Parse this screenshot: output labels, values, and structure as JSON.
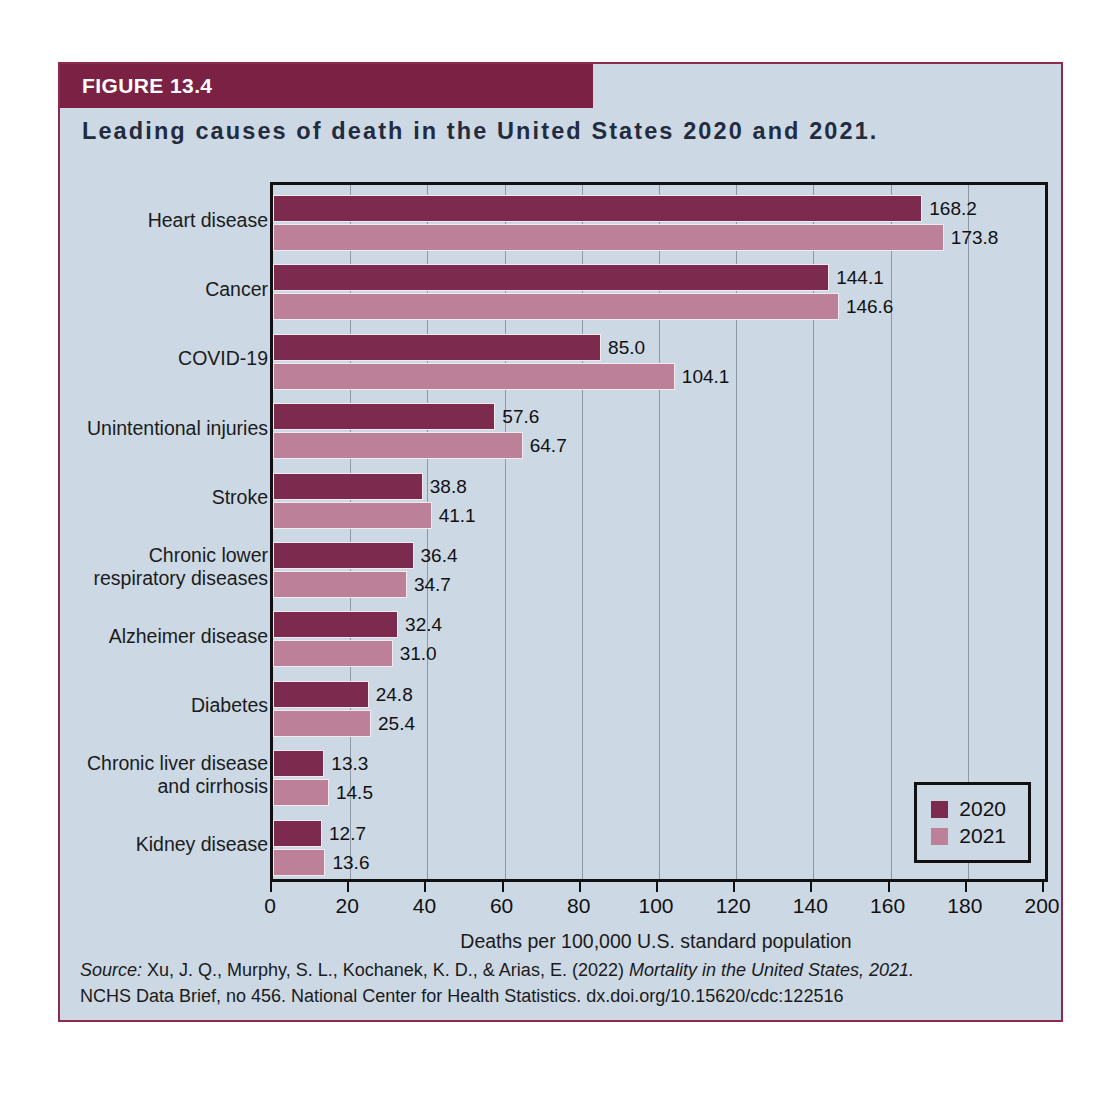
{
  "figure": {
    "label": "FIGURE 13.4",
    "title": "Leading causes of death in the United States 2020 and 2021.",
    "source_prefix": "Source:",
    "source_line1_a": " Xu, J. Q., Murphy, S. L., Kochanek, K. D., & Arias, E. (2022) ",
    "source_line1_italic": "Mortality in the United States, 2021.",
    "source_line2": "NCHS Data Brief, no 456. National Center for Health Statistics. dx.doi.org/10.15620/cdc:122516"
  },
  "colors": {
    "header_bar": "#7b2244",
    "figure_bg": "#ccd8e4",
    "figure_border": "#8e2a4e",
    "series_2020": "#7d2a4f",
    "series_2021": "#bd8099",
    "axis": "#111111",
    "gridline": "#8e98a4",
    "title_text": "#232b3e"
  },
  "legend": {
    "position": "bottom-right",
    "entries": [
      {
        "label": "2020",
        "color": "#7d2a4f"
      },
      {
        "label": "2021",
        "color": "#bd8099"
      }
    ]
  },
  "chart_data": {
    "type": "bar",
    "orientation": "horizontal",
    "title": "Leading causes of death in the United States 2020 and 2021.",
    "xlabel": "Deaths per 100,000 U.S. standard population",
    "ylabel": "",
    "xlim": [
      0,
      200
    ],
    "xticks": [
      0,
      20,
      40,
      60,
      80,
      100,
      120,
      140,
      160,
      180,
      200
    ],
    "grid": true,
    "grid_axis": "x",
    "legend_position": "lower right",
    "categories": [
      "Heart disease",
      "Cancer",
      "COVID-19",
      "Unintentional injuries",
      "Stroke",
      "Chronic lower respiratory diseases",
      "Alzheimer disease",
      "Diabetes",
      "Chronic liver disease and cirrhosis",
      "Kidney disease"
    ],
    "category_lines": [
      [
        "Heart disease"
      ],
      [
        "Cancer"
      ],
      [
        "COVID-19"
      ],
      [
        "Unintentional injuries"
      ],
      [
        "Stroke"
      ],
      [
        "Chronic lower",
        "respiratory diseases"
      ],
      [
        "Alzheimer disease"
      ],
      [
        "Diabetes"
      ],
      [
        "Chronic liver disease",
        "and cirrhosis"
      ],
      [
        "Kidney disease"
      ]
    ],
    "series": [
      {
        "name": "2020",
        "color": "#7d2a4f",
        "values": [
          168.2,
          144.1,
          85.0,
          57.6,
          38.8,
          36.4,
          32.4,
          24.8,
          13.3,
          12.7
        ],
        "labels": [
          "168.2",
          "144.1",
          "85.0",
          "57.6",
          "38.8",
          "36.4",
          "32.4",
          "24.8",
          "13.3",
          "12.7"
        ]
      },
      {
        "name": "2021",
        "color": "#bd8099",
        "values": [
          173.8,
          146.6,
          104.1,
          64.7,
          41.1,
          34.7,
          31.0,
          25.4,
          14.5,
          13.6
        ],
        "labels": [
          "173.8",
          "146.6",
          "104.1",
          "64.7",
          "41.1",
          "34.7",
          "31.0",
          "25.4",
          "14.5",
          "13.6"
        ]
      }
    ]
  }
}
